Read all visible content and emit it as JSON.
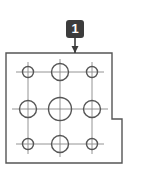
{
  "figure": {
    "type": "engineering-drawing",
    "background_color": "#ffffff",
    "line_color": "#555555",
    "centerline_color": "#888888",
    "badge_color": "#3c3c3c",
    "badge_text_color": "#ffffff",
    "stroke_width": 1.4
  },
  "callout": {
    "label": "1",
    "badge": {
      "x": 66,
      "y": 20,
      "width": 18,
      "height": 18,
      "corner_radius": 3
    },
    "leader": {
      "x": 75,
      "y_start": 38,
      "y_end": 53
    },
    "arrow": {
      "tip_x": 75,
      "tip_y": 53,
      "half_width": 3.5,
      "height": 7
    }
  },
  "part_outline": {
    "name": "plate-outline",
    "points": "6,53 112,53 112,119 122,119 122,163 6,163",
    "closed": true,
    "description": "rectangular plate with stepped notch at lower right"
  },
  "holes": [
    {
      "id": "hole-top-left",
      "cx": 28,
      "cy": 72,
      "r": 5.5,
      "size": "small"
    },
    {
      "id": "hole-top-center",
      "cx": 60,
      "cy": 72,
      "r": 8.5,
      "size": "medium"
    },
    {
      "id": "hole-top-right",
      "cx": 92,
      "cy": 72,
      "r": 5.5,
      "size": "small"
    },
    {
      "id": "hole-middle-left",
      "cx": 28,
      "cy": 109,
      "r": 8.5,
      "size": "medium"
    },
    {
      "id": "hole-middle-center",
      "cx": 60,
      "cy": 109,
      "r": 11.5,
      "size": "large"
    },
    {
      "id": "hole-middle-right",
      "cx": 92,
      "cy": 109,
      "r": 8.5,
      "size": "medium"
    },
    {
      "id": "hole-bottom-left",
      "cx": 28,
      "cy": 144,
      "r": 5.5,
      "size": "small"
    },
    {
      "id": "hole-bottom-center",
      "cx": 60,
      "cy": 144,
      "r": 8.5,
      "size": "medium"
    },
    {
      "id": "hole-bottom-right",
      "cx": 92,
      "cy": 144,
      "r": 5.5,
      "size": "small"
    }
  ],
  "centerlines": {
    "horizontal": [
      {
        "y": 72,
        "x1": 16,
        "x2": 104
      },
      {
        "y": 109,
        "x1": 12,
        "x2": 108
      },
      {
        "y": 144,
        "x1": 16,
        "x2": 104
      }
    ],
    "vertical": [
      {
        "x": 28,
        "y1": 62,
        "y2": 154
      },
      {
        "x": 60,
        "y1": 59,
        "y2": 157
      },
      {
        "x": 92,
        "y1": 62,
        "y2": 154
      }
    ]
  }
}
